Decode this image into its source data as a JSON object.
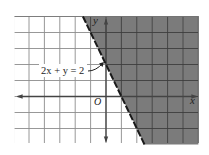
{
  "chart_data": {
    "type": "inequality-graph",
    "title": "",
    "boundary_equation": "2x + y = 2",
    "boundary_style": "dashed",
    "shaded_region": "2x + y > 2",
    "boundary_points": [
      [
        0,
        2
      ],
      [
        1,
        0
      ]
    ],
    "xlim": [
      -6,
      6
    ],
    "ylim": [
      -3,
      5
    ],
    "grid": true,
    "grid_step": 1,
    "xlabel": "x",
    "ylabel": "y",
    "origin_label": "O",
    "annotations": [
      {
        "text": "2x + y = 2",
        "points_to": [
          0,
          2
        ]
      }
    ],
    "colors": {
      "shade": "#7b7b7b",
      "grid_light": "#9a9a9a",
      "grid_dark": "#3a3a3a",
      "axis": "#444444",
      "boundary": "#1a1a1a"
    }
  },
  "labels": {
    "x_axis": "x",
    "y_axis": "y",
    "origin": "O",
    "equation": "2x + y = 2"
  }
}
